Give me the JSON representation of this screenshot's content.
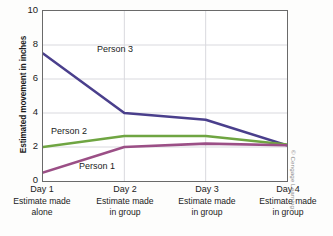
{
  "chart_data": {
    "type": "line",
    "title": "",
    "xlabel": "",
    "ylabel": "Estimated movement in inches",
    "ylim": [
      0,
      10
    ],
    "yticks": [
      10,
      8,
      6,
      4,
      2,
      0
    ],
    "grid": "horizontal-and-vertical",
    "legend_position": "inline-labels",
    "categories": [
      "Day 1",
      "Day 2",
      "Day 3",
      "Day 4"
    ],
    "category_sublabels": [
      "Estimate made alone",
      "Estimate made in group",
      "Estimate made in group",
      "Estimate made in group"
    ],
    "series": [
      {
        "name": "Person 3",
        "color": "#4a3f8c",
        "values": [
          7.5,
          4.0,
          3.6,
          2.1
        ]
      },
      {
        "name": "Person 2",
        "color": "#6fa542",
        "values": [
          2.0,
          2.65,
          2.65,
          2.15
        ]
      },
      {
        "name": "Person 1",
        "color": "#9b4f86",
        "values": [
          0.5,
          2.0,
          2.2,
          2.1
        ]
      }
    ]
  },
  "axis": {
    "y_title": "Estimated movement in inches",
    "y_tick_labels": [
      "10",
      "8",
      "6",
      "4",
      "2",
      "0"
    ]
  },
  "x_axis": {
    "groups": [
      {
        "day": "Day 1",
        "line1": "Estimate made",
        "line2": "alone"
      },
      {
        "day": "Day 2",
        "line1": "Estimate made",
        "line2": "in group"
      },
      {
        "day": "Day 3",
        "line1": "Estimate made",
        "line2": "in group"
      },
      {
        "day": "Day 4",
        "line1": "Estimate made",
        "line2": "in group"
      }
    ]
  },
  "series_labels": {
    "person3": "Person 3",
    "person2": "Person 2",
    "person1": "Person 1"
  },
  "credit": {
    "text": "© Cengage Learning"
  },
  "colors": {
    "person3": "#4a3f8c",
    "person2": "#6fa542",
    "person1": "#9b4f86",
    "frame": "#6a6a6a",
    "gridline": "#d9d9de",
    "text": "#1b1b1b"
  }
}
